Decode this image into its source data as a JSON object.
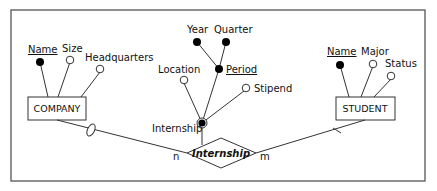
{
  "diagram": {
    "type": "ER diagram",
    "colors": {
      "line": "#333333",
      "frame": "#555555",
      "fill_key": "#000000",
      "fill_open": "#ffffff"
    },
    "entities": [
      {
        "name": "COMPANY",
        "attributes": [
          {
            "label": "Name",
            "key": true
          },
          {
            "label": "Size",
            "key": false
          },
          {
            "label": "Headquarters",
            "key": false
          }
        ]
      },
      {
        "name": "STUDENT",
        "attributes": [
          {
            "label": "Name",
            "key": true
          },
          {
            "label": "Major",
            "key": false
          },
          {
            "label": "Status",
            "key": false
          }
        ]
      }
    ],
    "relationship": {
      "name": "Internship",
      "identifier_label": "Internship",
      "attributes": [
        {
          "label": "Location",
          "key": false
        },
        {
          "label": "Period",
          "key": true,
          "components": [
            "Year",
            "Quarter"
          ]
        },
        {
          "label": "Stipend",
          "key": false
        }
      ],
      "cardinality_left": "n",
      "cardinality_right": "m"
    }
  }
}
